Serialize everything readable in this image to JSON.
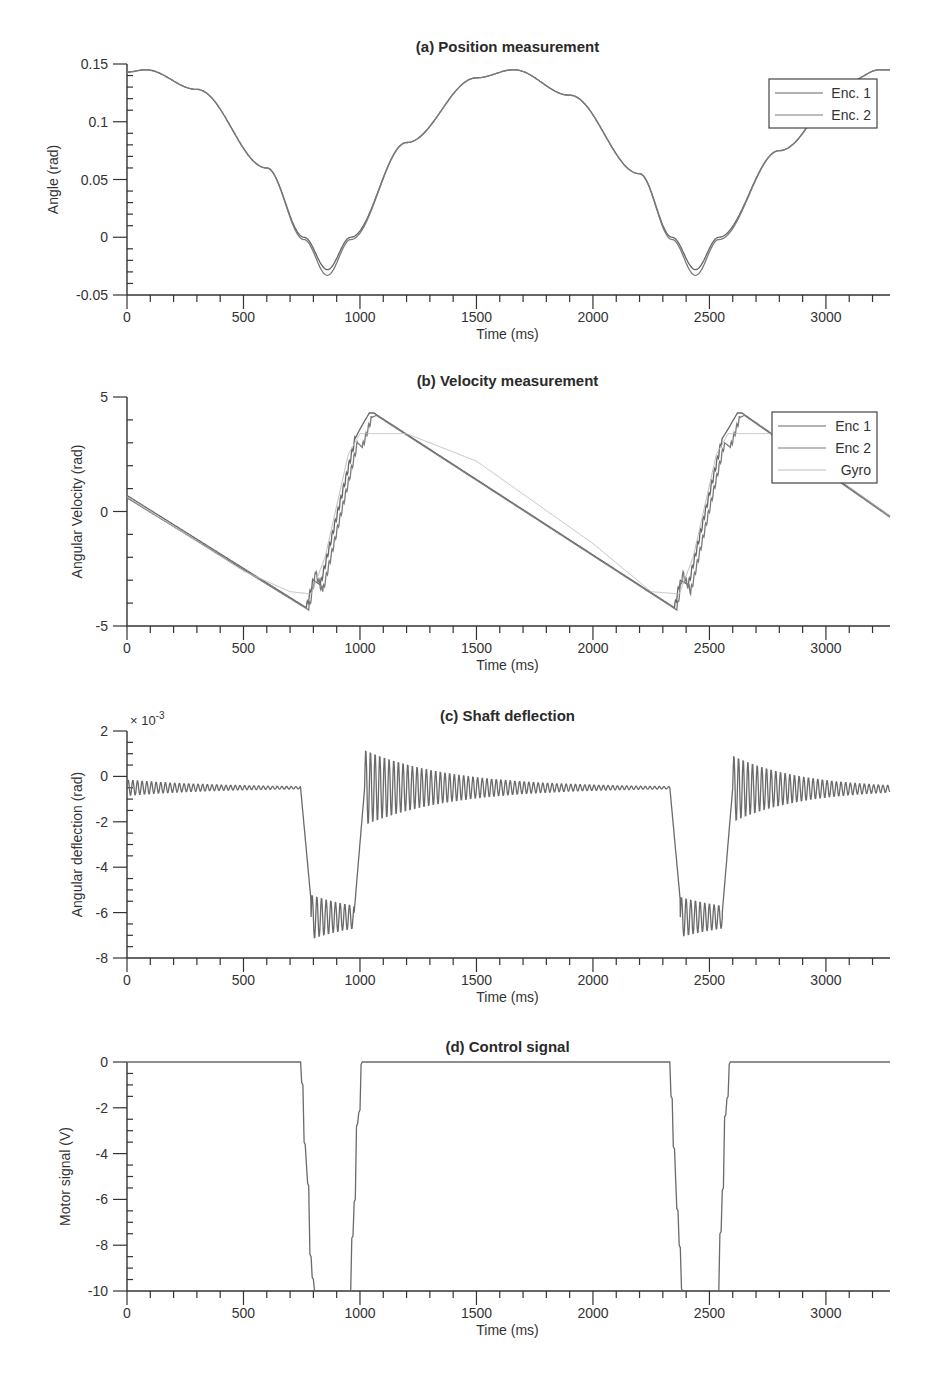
{
  "colors": {
    "axis": "#333333",
    "enc1": "#666666",
    "enc2": "#7a7a7a",
    "gyro": "#bdbdbd",
    "signal": "#6a6a6a",
    "legend_border": "#444444"
  },
  "chart_data": [
    {
      "id": "a",
      "type": "line",
      "title": "(a) Position measurement",
      "xlabel": "Time (ms)",
      "ylabel": "Angle (rad)",
      "xlim": [
        0,
        3275
      ],
      "ylim": [
        -0.05,
        0.15
      ],
      "xticks": [
        0,
        500,
        1000,
        1500,
        2000,
        2500,
        3000
      ],
      "xtick_labels": [
        "0",
        "500",
        "1000",
        "1500",
        "2000",
        "2500",
        "3000"
      ],
      "yticks": [
        -0.05,
        0,
        0.05,
        0.1,
        0.15
      ],
      "ytick_labels": [
        "-0.05",
        "0",
        "0.05",
        "0.1",
        "0.15"
      ],
      "grid": false,
      "legend": {
        "position": "upper right",
        "entries": [
          "Enc. 1",
          "Enc. 2"
        ]
      },
      "series": [
        {
          "name": "Enc. 1",
          "x": [
            0,
            80,
            300,
            600,
            760,
            860,
            960,
            1200,
            1500,
            1660,
            1900,
            2200,
            2340,
            2440,
            2540,
            2800,
            3100,
            3230,
            3275
          ],
          "values": [
            0.143,
            0.145,
            0.128,
            0.06,
            0.0,
            -0.028,
            0.0,
            0.082,
            0.138,
            0.145,
            0.123,
            0.055,
            0.0,
            -0.028,
            0.0,
            0.075,
            0.135,
            0.145,
            0.145
          ]
        },
        {
          "name": "Enc. 2",
          "x": [
            0,
            80,
            300,
            600,
            760,
            860,
            960,
            1200,
            1500,
            1660,
            1900,
            2200,
            2340,
            2440,
            2540,
            2800,
            3100,
            3230,
            3275
          ],
          "values": [
            0.143,
            0.145,
            0.128,
            0.06,
            -0.002,
            -0.033,
            -0.002,
            0.082,
            0.138,
            0.145,
            0.123,
            0.055,
            -0.002,
            -0.033,
            -0.002,
            0.075,
            0.135,
            0.145,
            0.145
          ]
        }
      ]
    },
    {
      "id": "b",
      "type": "line",
      "title": "(b) Velocity measurement",
      "xlabel": "Time (ms)",
      "ylabel": "Angular Velocity (rad)",
      "xlim": [
        0,
        3275
      ],
      "ylim": [
        -5,
        5
      ],
      "xticks": [
        0,
        500,
        1000,
        1500,
        2000,
        2500,
        3000
      ],
      "xtick_labels": [
        "0",
        "500",
        "1000",
        "1500",
        "2000",
        "2500",
        "3000"
      ],
      "yticks": [
        -5,
        0,
        5
      ],
      "ytick_labels": [
        "-5",
        "0",
        "5"
      ],
      "grid": false,
      "legend": {
        "position": "upper right",
        "entries": [
          "Enc 1",
          "Enc 2",
          "Gyro"
        ]
      },
      "series": [
        {
          "name": "Enc 1",
          "x": [
            0,
            770,
            800,
            830,
            980,
            1000,
            1040,
            1060,
            2350,
            2375,
            2410,
            2555,
            2580,
            2620,
            2640,
            3275
          ],
          "values": [
            0.7,
            -4.2,
            -3.0,
            -3.2,
            3.2,
            3.6,
            4.3,
            4.3,
            -4.2,
            -3.0,
            -3.2,
            3.2,
            3.6,
            4.3,
            4.3,
            -0.2
          ]
        },
        {
          "name": "Enc 2",
          "x": [
            0,
            780,
            810,
            840,
            990,
            1010,
            1050,
            1070,
            2360,
            2385,
            2420,
            2565,
            2590,
            2630,
            2650,
            3275
          ],
          "values": [
            0.6,
            -4.3,
            -2.7,
            -3.5,
            3.0,
            2.8,
            4.1,
            4.2,
            -4.3,
            -2.7,
            -3.5,
            3.0,
            2.8,
            4.1,
            4.2,
            -0.25
          ]
        },
        {
          "name": "Gyro",
          "x": [
            0,
            500,
            700,
            790,
            850,
            950,
            1000,
            1200,
            1500,
            2000,
            2250,
            2370,
            2430,
            2530,
            2580,
            2780,
            3275
          ],
          "values": [
            0.65,
            -2.6,
            -3.5,
            -3.6,
            -2.0,
            2.5,
            3.4,
            3.4,
            2.2,
            -1.4,
            -3.5,
            -3.6,
            -2.0,
            2.5,
            3.4,
            3.4,
            -0.2
          ]
        }
      ]
    },
    {
      "id": "c",
      "type": "line",
      "title": "(c) Shaft deflection",
      "xlabel": "Time (ms)",
      "ylabel": "Angular deflection (rad)",
      "y_multiplier": "× 10-3",
      "xlim": [
        0,
        3275
      ],
      "ylim": [
        -8,
        2
      ],
      "xticks": [
        0,
        500,
        1000,
        1500,
        2000,
        2500,
        3000
      ],
      "xtick_labels": [
        "0",
        "500",
        "1000",
        "1500",
        "2000",
        "2500",
        "3000"
      ],
      "yticks": [
        -8,
        -6,
        -4,
        -2,
        0,
        2
      ],
      "ytick_labels": [
        "-8",
        "-6",
        "-4",
        "-2",
        "0",
        "2"
      ],
      "grid": false,
      "series": [
        {
          "name": "Deflection",
          "segments": [
            {
              "t0": 0,
              "t1": 745,
              "base": -0.5,
              "amp0": 0.35,
              "amp1": 0.05,
              "period": 20
            },
            {
              "t0": 745,
              "t1": 790,
              "base_from": -0.5,
              "base_to": -5.5,
              "amp0": 0,
              "amp1": 0,
              "period": 20
            },
            {
              "t0": 790,
              "t1": 975,
              "base": -6.2,
              "amp0": 1.0,
              "amp1": 0.5,
              "period": 20
            },
            {
              "t0": 975,
              "t1": 1020,
              "base_from": -6.0,
              "base_to": -0.5,
              "amp0": 0,
              "amp1": 0,
              "period": 20
            },
            {
              "t0": 1020,
              "t1": 2330,
              "base": -0.5,
              "amp0": 1.7,
              "amp1": 0.05,
              "period": 20
            },
            {
              "t0": 2330,
              "t1": 2375,
              "base_from": -0.5,
              "base_to": -5.5,
              "amp0": 0,
              "amp1": 0,
              "period": 20
            },
            {
              "t0": 2375,
              "t1": 2555,
              "base": -6.2,
              "amp0": 0.9,
              "amp1": 0.5,
              "period": 20
            },
            {
              "t0": 2555,
              "t1": 2600,
              "base_from": -6.0,
              "base_to": -0.5,
              "amp0": 0,
              "amp1": 0,
              "period": 20
            },
            {
              "t0": 2600,
              "t1": 3275,
              "base": -0.55,
              "amp0": 1.5,
              "amp1": 0.15,
              "period": 20
            }
          ]
        }
      ]
    },
    {
      "id": "d",
      "type": "line",
      "title": "(d) Control signal",
      "xlabel": "Time (ms)",
      "ylabel": "Motor signal (V)",
      "xlim": [
        0,
        3275
      ],
      "ylim": [
        -10,
        0
      ],
      "xticks": [
        0,
        500,
        1000,
        1500,
        2000,
        2500,
        3000
      ],
      "xtick_labels": [
        "0",
        "500",
        "1000",
        "1500",
        "2000",
        "2500",
        "3000"
      ],
      "yticks": [
        -10,
        -8,
        -6,
        -4,
        -2,
        0
      ],
      "ytick_labels": [
        "-10",
        "-8",
        "-6",
        "-4",
        "-2",
        "0"
      ],
      "grid": false,
      "series": [
        {
          "name": "Motor signal",
          "x": [
            0,
            745,
            750,
            755,
            760,
            765,
            775,
            780,
            785,
            790,
            795,
            800,
            805,
            960,
            965,
            970,
            975,
            980,
            985,
            990,
            995,
            1000,
            1005,
            1010,
            2330,
            2335,
            2340,
            2345,
            2350,
            2360,
            2365,
            2370,
            2375,
            2380,
            2385,
            2540,
            2545,
            2550,
            2555,
            2560,
            2565,
            2570,
            2575,
            2580,
            2585,
            2590,
            3275
          ],
          "values": [
            0,
            0,
            -0.9,
            -1.0,
            -3.5,
            -3.6,
            -5.3,
            -5.4,
            -8.4,
            -8.5,
            -9.4,
            -9.5,
            -10,
            -10,
            -7.7,
            -7.6,
            -6.1,
            -6.0,
            -2.8,
            -2.7,
            -2.2,
            -2.1,
            -0.1,
            0,
            0,
            -1.5,
            -1.6,
            -3.7,
            -3.8,
            -6.4,
            -6.5,
            -8.0,
            -8.1,
            -9.9,
            -10,
            -10,
            -7.5,
            -7.4,
            -5.6,
            -5.5,
            -2.4,
            -2.3,
            -1.6,
            -1.5,
            -0.1,
            0,
            0
          ]
        }
      ]
    }
  ],
  "layout": {
    "plot_left": 127,
    "plot_right": 890,
    "panels": [
      {
        "id": "a",
        "top": 64,
        "bottom": 295,
        "title_y": 52,
        "ylabel_x": 58,
        "ytick_minor": 0.01,
        "legend": {
          "x": 769,
          "y": 79,
          "w": 108,
          "h": 49
        }
      },
      {
        "id": "b",
        "top": 397,
        "bottom": 626,
        "title_y": 386,
        "ylabel_x": 82,
        "ytick_minor": 1,
        "legend": {
          "x": 772,
          "y": 412,
          "w": 105,
          "h": 71
        }
      },
      {
        "id": "c",
        "top": 731,
        "bottom": 958,
        "title_y": 721,
        "ylabel_x": 82,
        "ytick_minor": 0.5
      },
      {
        "id": "d",
        "top": 1062,
        "bottom": 1291,
        "title_y": 1052,
        "ylabel_x": 70,
        "ytick_minor": 0.5
      }
    ]
  }
}
